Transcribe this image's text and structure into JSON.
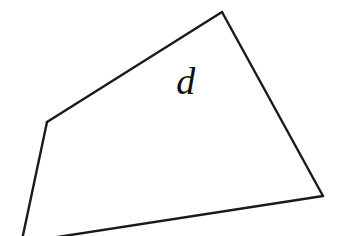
{
  "figure": {
    "background_color": "#ffffff",
    "stroke_color": "#1a1a1a",
    "stroke_width": 2.4,
    "canvas": {
      "width": 347,
      "height": 236
    },
    "shape": {
      "name": "quadrilateral-outline",
      "type": "polyline",
      "closed": false,
      "fill": "none",
      "description": "Open quadrilateral outline whose lower-left corner extends past the bottom edge of the frame",
      "vertices": [
        {
          "name": "bottom-left-offscreen",
          "x": 22,
          "y": 240,
          "visible": false
        },
        {
          "name": "left-vertex",
          "x": 47,
          "y": 122,
          "visible": true
        },
        {
          "name": "top-vertex",
          "x": 222,
          "y": 12,
          "visible": true
        },
        {
          "name": "right-vertex",
          "x": 323,
          "y": 196,
          "visible": true
        },
        {
          "name": "bottom-edge-offscreen",
          "x": 38,
          "y": 240,
          "visible": false
        }
      ],
      "edges": [
        {
          "name": "lower-left-edge",
          "from": "bottom-left-offscreen",
          "to": "left-vertex"
        },
        {
          "name": "upper-left-edge",
          "from": "left-vertex",
          "to": "top-vertex"
        },
        {
          "name": "right-edge",
          "from": "top-vertex",
          "to": "right-vertex"
        },
        {
          "name": "bottom-edge",
          "from": "right-vertex",
          "to": "bottom-edge-offscreen"
        }
      ]
    },
    "labels": [
      {
        "name": "region-label-d",
        "text": "d",
        "x": 188,
        "y": 83,
        "font_size": 38,
        "style": "italic",
        "color": "#111111"
      }
    ]
  }
}
